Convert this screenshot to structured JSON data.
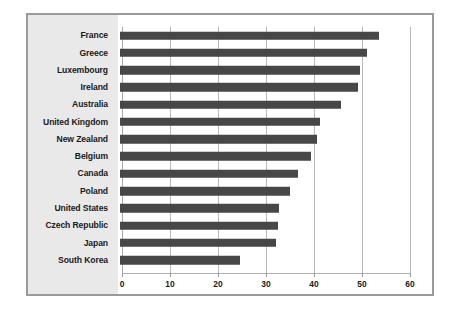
{
  "chart_data": {
    "type": "bar",
    "orientation": "horizontal",
    "title": "",
    "subtitle": "",
    "xlabel": "",
    "ylabel": "",
    "xlim": [
      0,
      60
    ],
    "xticks": [
      0,
      10,
      20,
      30,
      40,
      50,
      60
    ],
    "xtick_labels": [
      "0",
      "10",
      "20",
      "30",
      "40",
      "50",
      "60"
    ],
    "grid": true,
    "grid_axis": "x",
    "legend": false,
    "legend_position": "none",
    "bar_color": "#474747",
    "panel_color": "#e9e9e9",
    "frame_color": "#9a9a9a",
    "gridline_color": "#b9b9b9",
    "categories": [
      "France",
      "Greece",
      "Luxembourg",
      "Ireland",
      "Australia",
      "United Kingdom",
      "New Zealand",
      "Belgium",
      "Canada",
      "Poland",
      "United States",
      "Czech Republic",
      "Japan",
      "South Korea"
    ],
    "values": [
      54,
      51.5,
      50,
      49.5,
      46,
      41.7,
      41,
      39.7,
      37,
      35.5,
      33.2,
      33,
      32.5,
      25
    ]
  }
}
